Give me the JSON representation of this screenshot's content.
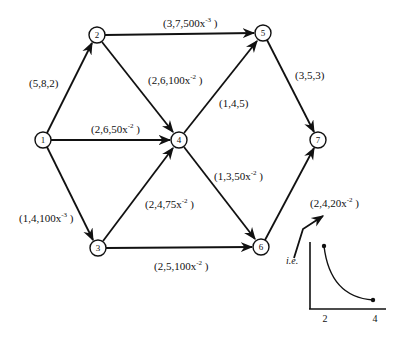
{
  "diagram": {
    "type": "directed-network",
    "nodes": [
      {
        "id": "1",
        "label": "1",
        "x": 43,
        "y": 140
      },
      {
        "id": "2",
        "label": "2",
        "x": 97,
        "y": 35
      },
      {
        "id": "3",
        "label": "3",
        "x": 98,
        "y": 248
      },
      {
        "id": "4",
        "label": "4",
        "x": 179,
        "y": 140
      },
      {
        "id": "5",
        "label": "5",
        "x": 263,
        "y": 33
      },
      {
        "id": "6",
        "label": "6",
        "x": 261,
        "y": 247
      },
      {
        "id": "7",
        "label": "7",
        "x": 318,
        "y": 140
      }
    ],
    "edges": [
      {
        "from": "1",
        "to": "2",
        "label": "(5,8,2)",
        "base": "(5,8,2)",
        "sup": ""
      },
      {
        "from": "1",
        "to": "4",
        "label": "(2,6,50x^-2)",
        "base": "(2,6,50x",
        "sup": "-2",
        "close": " )"
      },
      {
        "from": "1",
        "to": "3",
        "label": "(1,4,100x^-3)",
        "base": "(1,4,100x",
        "sup": "-3",
        "close": " )"
      },
      {
        "from": "2",
        "to": "5",
        "label": "(3,7,500x^-3)",
        "base": "(3,7,500x",
        "sup": "-3",
        "close": " )"
      },
      {
        "from": "2",
        "to": "4",
        "label": "(2,6,100x^-2)",
        "base": "(2,6,100x",
        "sup": "-2",
        "close": " )"
      },
      {
        "from": "3",
        "to": "4",
        "label": "(2,4,75x^-2)",
        "base": "(2,4,75x",
        "sup": "-2",
        "close": " )"
      },
      {
        "from": "3",
        "to": "6",
        "label": "(2,5,100x^-2)",
        "base": "(2,5,100x",
        "sup": "-2",
        "close": " )"
      },
      {
        "from": "4",
        "to": "5",
        "label": "(1,4,5)",
        "base": "(1,4,5)",
        "sup": ""
      },
      {
        "from": "4",
        "to": "6",
        "label": "(1,3,50x^-2)",
        "base": "(1,3,50x",
        "sup": "-2",
        "close": " )"
      },
      {
        "from": "5",
        "to": "7",
        "label": "(3,5,3)",
        "base": "(3,5,3)",
        "sup": ""
      },
      {
        "from": "6",
        "to": "7",
        "label": "(2,4,20x^-2)",
        "base": "(2,4,20x",
        "sup": "-2",
        "close": " )"
      }
    ],
    "annotation": {
      "text": "i.e.",
      "inset": {
        "x_ticks": [
          "2",
          "4"
        ],
        "curve": "decreasing convex curve from x=2 to x=4 with endpoint dots"
      }
    }
  }
}
